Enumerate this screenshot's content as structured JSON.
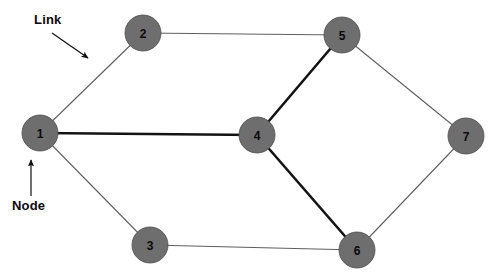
{
  "diagram": {
    "type": "network-graph",
    "title": "",
    "width": 500,
    "height": 279,
    "background_color": "#ffffff",
    "node_fill_color": "#6e6e6e",
    "node_stroke_color": "#4d4d4d",
    "node_label_color": "#0a0a0a",
    "thin_edge_color": "#5f5f5f",
    "thick_edge_color": "#131313",
    "node_radius": 18,
    "nodes": [
      {
        "id": "1",
        "label": "1",
        "x": 40,
        "y": 133
      },
      {
        "id": "2",
        "label": "2",
        "x": 143,
        "y": 33
      },
      {
        "id": "3",
        "label": "3",
        "x": 150,
        "y": 245
      },
      {
        "id": "4",
        "label": "4",
        "x": 257,
        "y": 135
      },
      {
        "id": "5",
        "label": "5",
        "x": 342,
        "y": 35
      },
      {
        "id": "6",
        "label": "6",
        "x": 357,
        "y": 250
      },
      {
        "id": "7",
        "label": "7",
        "x": 466,
        "y": 136
      }
    ],
    "edges": [
      {
        "from": "1",
        "to": "2",
        "style": "thin"
      },
      {
        "from": "1",
        "to": "3",
        "style": "thin"
      },
      {
        "from": "1",
        "to": "4",
        "style": "thick"
      },
      {
        "from": "2",
        "to": "5",
        "style": "thin"
      },
      {
        "from": "3",
        "to": "6",
        "style": "thin"
      },
      {
        "from": "4",
        "to": "5",
        "style": "thick"
      },
      {
        "from": "4",
        "to": "6",
        "style": "thick"
      },
      {
        "from": "5",
        "to": "7",
        "style": "thin"
      },
      {
        "from": "6",
        "to": "7",
        "style": "thin"
      }
    ],
    "annotations": [
      {
        "id": "link",
        "label": "Link",
        "label_x": 34,
        "label_y": 12,
        "arrow_from_x": 52,
        "arrow_from_y": 33,
        "arrow_to_x": 88,
        "arrow_to_y": 58
      },
      {
        "id": "node",
        "label": "Node",
        "label_x": 12,
        "label_y": 198,
        "arrow_from_x": 31,
        "arrow_from_y": 196,
        "arrow_to_x": 31,
        "arrow_to_y": 160
      }
    ]
  }
}
